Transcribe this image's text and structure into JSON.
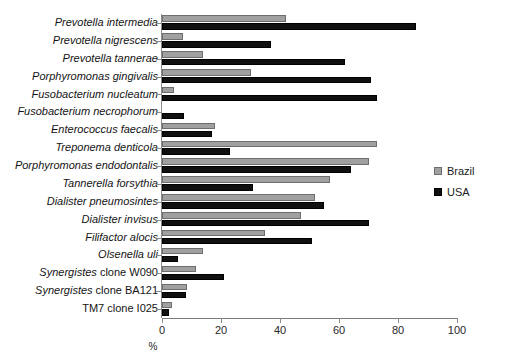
{
  "chart_data": {
    "type": "bar",
    "orientation": "horizontal",
    "title": "",
    "xlabel": "%",
    "ylabel": "",
    "xlim": [
      0,
      100
    ],
    "xticks": [
      0,
      20,
      40,
      60,
      80,
      100
    ],
    "grid": false,
    "legend_position": "right",
    "categories": [
      "Prevotella intermedia",
      "Prevotella nigrescens",
      "Prevotella tannerae",
      "Porphyromonas gingivalis",
      "Fusobacterium nucleatum",
      "Fusobacterium necrophorum",
      "Enterococcus faecalis",
      "Treponema denticola",
      "Porphyromonas endodontalis",
      "Tannerella forsythia",
      "Dialister pneumosintes",
      "Dialister invisus",
      "Filifactor alocis",
      "Olsenella uli",
      "Synergistes clone W090",
      "Synergistes clone BA121",
      "TM7 clone I025"
    ],
    "category_italic_prefix": [
      "Prevotella intermedia",
      "Prevotella nigrescens",
      "Prevotella tannerae",
      "Porphyromonas gingivalis",
      "Fusobacterium nucleatum",
      "Fusobacterium necrophorum",
      "Enterococcus faecalis",
      "Treponema denticola",
      "Porphyromonas endodontalis",
      "Tannerella forsythia",
      "Dialister pneumosintes",
      "Dialister invisus",
      "Filifactor alocis",
      "Olsenella uli",
      "Synergistes",
      "Synergistes",
      ""
    ],
    "category_plain_suffix": [
      "",
      "",
      "",
      "",
      "",
      "",
      "",
      "",
      "",
      "",
      "",
      "",
      "",
      "",
      " clone W090",
      " clone BA121",
      "TM7 clone I025"
    ],
    "series": [
      {
        "name": "Brazil",
        "color": "#a0a0a0",
        "values": [
          42,
          7,
          14,
          30,
          4,
          0,
          18,
          73,
          70,
          57,
          52,
          47,
          35,
          14,
          11.5,
          8.5,
          3.5
        ]
      },
      {
        "name": "USA",
        "color": "#101010",
        "values": [
          86,
          37,
          62,
          71,
          73,
          7.5,
          17,
          23,
          64,
          31,
          55,
          70,
          51,
          5.5,
          21,
          8,
          2.5
        ]
      }
    ]
  },
  "legend": {
    "items": [
      {
        "label": "Brazil",
        "color": "#a0a0a0"
      },
      {
        "label": "USA",
        "color": "#101010"
      }
    ]
  }
}
